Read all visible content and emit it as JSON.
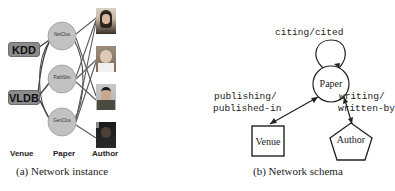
{
  "panel_a": {
    "caption": "(a) Network instance",
    "venues": [
      {
        "label": "KDD"
      },
      {
        "label": "VLDB"
      }
    ],
    "papers": [
      {
        "label": "NetClus"
      },
      {
        "label": "PathSim"
      },
      {
        "label": "GenClus"
      }
    ],
    "authors_count": 4,
    "column_labels": {
      "venue": "Venue",
      "paper": "Paper",
      "author": "Author"
    },
    "colors": {
      "venue_fill": "#8c8c8c",
      "paper_fill": "#c2c2c2",
      "edge": "#4a4a4a"
    }
  },
  "panel_b": {
    "caption": "(b) Network schema",
    "nodes": {
      "paper": "Paper",
      "venue": "Venue",
      "author": "Author"
    },
    "relations": {
      "self_loop": "citing/cited",
      "venue_line1": "publishing/",
      "venue_line2": "published-in",
      "author_line1": "writing/",
      "author_line2": "written-by"
    }
  }
}
